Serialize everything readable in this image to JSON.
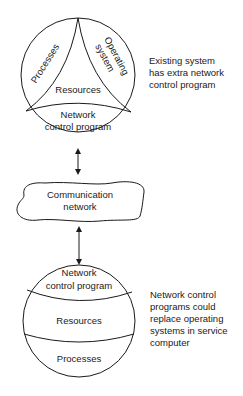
{
  "top_system": {
    "segments": {
      "processes": "Processes",
      "operating_system_line1": "Operating",
      "operating_system_line2": "system",
      "resources": "Resources",
      "ncp_line1": "Network",
      "ncp_line2": "control program"
    },
    "annotation": "Existing system\nhas extra network\ncontrol program"
  },
  "network": {
    "line1": "Communication",
    "line2": "network"
  },
  "bottom_system": {
    "layers": {
      "ncp_line1": "Network",
      "ncp_line2": "control program",
      "resources": "Resources",
      "processes": "Processes"
    },
    "annotation": "Network control\nprograms could\nreplace operating\nsystems in service\ncomputer"
  },
  "colors": {
    "line": "#1a1a1a",
    "background": "#ffffff"
  }
}
